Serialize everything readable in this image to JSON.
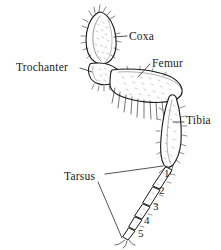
{
  "figure": {
    "background_color": "#ffffff",
    "ink_color": "#1a1a1a",
    "style": "line-drawing"
  },
  "labels": {
    "coxa": "Coxa",
    "trochanter": "Trochanter",
    "femur": "Femur",
    "tibia": "Tibia",
    "tarsus": "Tarsus"
  },
  "tarsal_segments": {
    "one": "1",
    "two": "2",
    "three": "3",
    "four": "4",
    "five": "5"
  }
}
